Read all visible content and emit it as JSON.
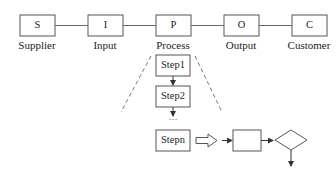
{
  "sipoc": [
    {
      "letter": "S",
      "label": "Supplier"
    },
    {
      "letter": "I",
      "label": "Input"
    },
    {
      "letter": "P",
      "label": "Process"
    },
    {
      "letter": "O",
      "label": "Output"
    },
    {
      "letter": "C",
      "label": "Customer"
    }
  ],
  "steps": [
    "Step1",
    "Step2",
    "…",
    "Stepn"
  ],
  "colors": {
    "stroke": "#555555",
    "text": "#222222"
  }
}
